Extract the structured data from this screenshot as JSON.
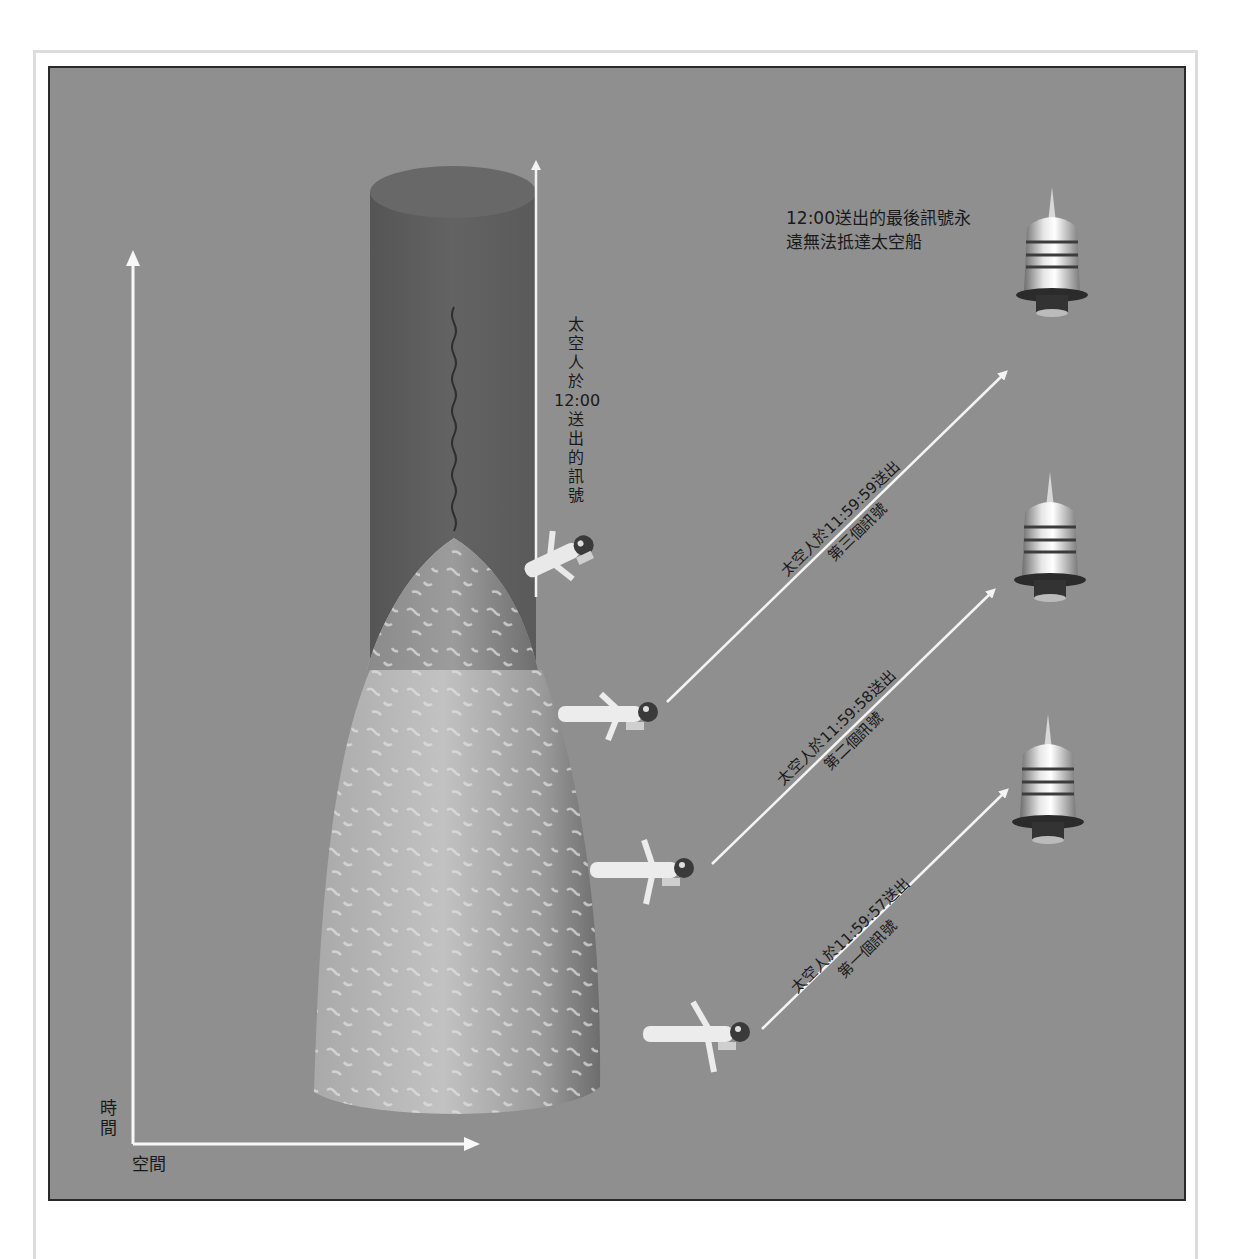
{
  "diagram": {
    "axes": {
      "time_label": "時間",
      "space_label": "空間"
    },
    "final_signal_note": {
      "line1": "12:00送出的最後訊號永",
      "line2": "遠無法抵達太空船"
    },
    "vertical_signal_label": [
      "太",
      "空",
      "人",
      "於",
      "12:00",
      "送",
      "出",
      "的",
      "訊",
      "號"
    ],
    "signals": [
      {
        "id": "third",
        "line1": "太空人於11:59:59送出",
        "line2": "第三個訊號"
      },
      {
        "id": "second",
        "line1": "太空人於11:59:58送出",
        "line2": "第二個訊號"
      },
      {
        "id": "first",
        "line1": "太空人於11:59:57送出",
        "line2": "第一個訊號"
      }
    ],
    "objects": {
      "black_hole_cylinder": "dark-cylinder",
      "star_surface": "collapsing-star-cone",
      "astronauts": 4,
      "spaceships": 3
    },
    "colors": {
      "background": "#8f8f8f",
      "cylinder": "#5e5e5e",
      "cone_light": "#b8b8b8",
      "cone_dark": "#7d7d7d",
      "arrow": "#f4f4f4",
      "text": "#1a1a1a"
    }
  }
}
